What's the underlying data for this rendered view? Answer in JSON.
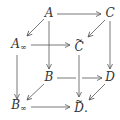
{
  "diagram": {
    "type": "commutative-cube",
    "nodes": {
      "A": {
        "label": "A",
        "x": 49,
        "y": 14
      },
      "C": {
        "label": "C",
        "x": 110,
        "y": 14
      },
      "A_inf": {
        "label": "A",
        "sub": "∞",
        "x": 17,
        "y": 47
      },
      "C_tilde": {
        "label": "C",
        "x": 78,
        "y": 47
      },
      "B": {
        "label": "B",
        "x": 49,
        "y": 78
      },
      "D": {
        "label": "D",
        "x": 110,
        "y": 78
      },
      "B_inf": {
        "label": "B",
        "sub": "∞",
        "x": 17,
        "y": 108
      },
      "D_tilde": {
        "label": "D",
        "suffix": ".",
        "x": 78,
        "y": 108
      }
    },
    "edges": [
      {
        "from": "A",
        "to": "C"
      },
      {
        "from": "A",
        "to": "A_inf"
      },
      {
        "from": "A",
        "to": "B"
      },
      {
        "from": "C",
        "to": "C_tilde"
      },
      {
        "from": "C",
        "to": "D"
      },
      {
        "from": "A_inf",
        "to": "C_tilde"
      },
      {
        "from": "A_inf",
        "to": "B_inf"
      },
      {
        "from": "C_tilde",
        "to": "D_tilde"
      },
      {
        "from": "B",
        "to": "D"
      },
      {
        "from": "B",
        "to": "B_inf"
      },
      {
        "from": "D",
        "to": "D_tilde"
      },
      {
        "from": "B_inf",
        "to": "D_tilde"
      }
    ],
    "colors": {
      "stroke": "#555555",
      "text": "#333333"
    }
  }
}
